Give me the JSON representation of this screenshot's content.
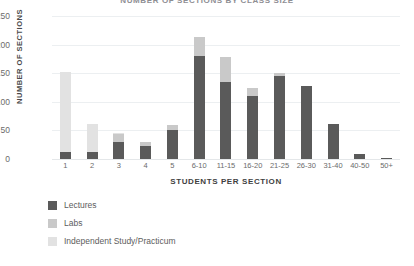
{
  "chart_data": {
    "type": "bar",
    "stacked": true,
    "title": "NUMBER OF SECTIONS BY CLASS SIZE",
    "xlabel": "STUDENTS PER SECTION",
    "ylabel": "NUMBER OF SECTIONS",
    "categories": [
      "1",
      "2",
      "3",
      "4",
      "5",
      "6-10",
      "11-15",
      "16-20",
      "21-25",
      "26-30",
      "31-40",
      "40-50",
      "50+"
    ],
    "series": [
      {
        "name": "Lectures",
        "color": "#5a5a5a",
        "values": [
          12,
          13,
          30,
          22,
          50,
          180,
          135,
          110,
          145,
          127,
          62,
          8,
          2
        ]
      },
      {
        "name": "Labs",
        "color": "#c9c9c9",
        "values": [
          0,
          0,
          14,
          8,
          10,
          33,
          43,
          15,
          5,
          0,
          0,
          0,
          0
        ]
      },
      {
        "name": "Independent Study/Practicum",
        "color": "#e2e2e2",
        "values": [
          140,
          49,
          1,
          0,
          0,
          0,
          0,
          0,
          0,
          0,
          0,
          0,
          0
        ]
      }
    ],
    "yticks": [
      0,
      50,
      100,
      150,
      200,
      250
    ],
    "ylim": [
      0,
      250
    ],
    "grid": true,
    "legend_position": "bottom-left"
  },
  "colors": {
    "lectures": "#5a5a5a",
    "labs": "#c9c9c9",
    "independent": "#e2e2e2",
    "gridline": "#eceff1",
    "tick_text": "#6b6b6b",
    "axis_title": "#3f3f3f",
    "background": "#ffffff"
  }
}
